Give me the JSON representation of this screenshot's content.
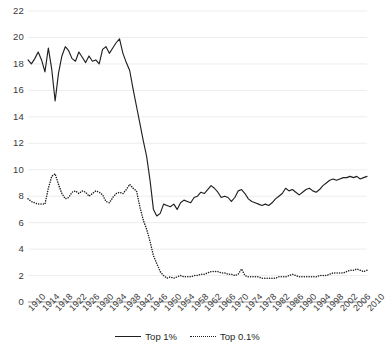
{
  "chart_data": {
    "type": "line",
    "title": "",
    "subtitle": "",
    "xlabel": "",
    "ylabel": "",
    "xlim": [
      1910,
      2010
    ],
    "ylim": [
      0,
      22
    ],
    "grid": true,
    "legend_position": "bottom",
    "y_ticks": [
      0,
      2,
      4,
      6,
      8,
      10,
      12,
      14,
      16,
      18,
      20,
      22
    ],
    "x_ticks": [
      1910,
      1914,
      1918,
      1922,
      1926,
      1930,
      1934,
      1938,
      1942,
      1946,
      1950,
      1954,
      1958,
      1962,
      1966,
      1970,
      1974,
      1978,
      1982,
      1986,
      1990,
      1994,
      1998,
      2002,
      2006,
      2010
    ],
    "x": [
      1910,
      1911,
      1912,
      1913,
      1914,
      1915,
      1916,
      1917,
      1918,
      1919,
      1920,
      1921,
      1922,
      1923,
      1924,
      1925,
      1926,
      1927,
      1928,
      1929,
      1930,
      1931,
      1932,
      1933,
      1934,
      1935,
      1936,
      1937,
      1938,
      1939,
      1940,
      1941,
      1942,
      1943,
      1944,
      1945,
      1946,
      1947,
      1948,
      1949,
      1950,
      1951,
      1952,
      1953,
      1954,
      1955,
      1956,
      1957,
      1958,
      1959,
      1960,
      1961,
      1962,
      1963,
      1964,
      1965,
      1966,
      1967,
      1968,
      1969,
      1970,
      1971,
      1972,
      1973,
      1974,
      1975,
      1976,
      1977,
      1978,
      1979,
      1980,
      1981,
      1982,
      1983,
      1984,
      1985,
      1986,
      1987,
      1988,
      1989,
      1990,
      1991,
      1992,
      1993,
      1994,
      1995,
      1996,
      1997,
      1998,
      1999,
      2000,
      2001,
      2002,
      2003,
      2004,
      2005,
      2006,
      2007,
      2008,
      2009,
      2010
    ],
    "series": [
      {
        "name": "Top 1%",
        "style": "solid",
        "color": "#231f20",
        "values": [
          18.3,
          18.0,
          18.4,
          18.9,
          18.3,
          17.4,
          19.2,
          17.6,
          15.2,
          17.3,
          18.6,
          19.3,
          19.0,
          18.4,
          18.2,
          18.9,
          18.5,
          18.1,
          18.6,
          18.2,
          18.3,
          18.0,
          19.1,
          19.3,
          18.8,
          19.2,
          19.6,
          19.9,
          18.8,
          18.1,
          17.5,
          16.1,
          14.8,
          13.5,
          12.2,
          11.0,
          9.2,
          7.0,
          6.5,
          6.7,
          7.4,
          7.3,
          7.2,
          7.4,
          7.0,
          7.5,
          7.7,
          7.6,
          7.5,
          7.9,
          8.0,
          8.3,
          8.2,
          8.5,
          8.8,
          8.6,
          8.3,
          7.9,
          8.0,
          7.9,
          7.6,
          7.9,
          8.4,
          8.5,
          8.2,
          7.8,
          7.6,
          7.5,
          7.4,
          7.3,
          7.4,
          7.3,
          7.5,
          7.8,
          8.0,
          8.2,
          8.6,
          8.4,
          8.5,
          8.3,
          8.1,
          8.3,
          8.5,
          8.6,
          8.4,
          8.3,
          8.5,
          8.8,
          9.0,
          9.2,
          9.3,
          9.2,
          9.3,
          9.4,
          9.4,
          9.5,
          9.4,
          9.5,
          9.3,
          9.4,
          9.5
        ]
      },
      {
        "name": "Top 0.1%",
        "style": "dotted",
        "color": "#231f20",
        "values": [
          7.8,
          7.6,
          7.5,
          7.4,
          7.4,
          7.4,
          8.6,
          9.5,
          9.7,
          8.9,
          8.2,
          7.8,
          7.9,
          8.3,
          8.4,
          8.2,
          8.4,
          8.3,
          8.0,
          8.2,
          8.4,
          8.3,
          8.1,
          7.6,
          7.5,
          7.9,
          8.2,
          8.3,
          8.2,
          8.5,
          8.9,
          8.6,
          8.4,
          7.2,
          6.2,
          5.5,
          4.6,
          3.5,
          2.9,
          2.3,
          2.0,
          1.8,
          1.9,
          1.8,
          1.9,
          2.0,
          1.9,
          1.9,
          1.9,
          2.0,
          2.0,
          2.1,
          2.1,
          2.2,
          2.3,
          2.3,
          2.3,
          2.2,
          2.2,
          2.1,
          2.1,
          2.0,
          2.1,
          2.5,
          2.0,
          1.9,
          1.9,
          1.9,
          1.9,
          1.8,
          1.8,
          1.8,
          1.8,
          1.8,
          1.9,
          1.9,
          1.9,
          2.0,
          2.1,
          2.0,
          1.9,
          1.9,
          1.9,
          1.9,
          1.9,
          1.9,
          2.0,
          2.0,
          2.0,
          2.1,
          2.2,
          2.2,
          2.2,
          2.2,
          2.3,
          2.4,
          2.4,
          2.5,
          2.4,
          2.3,
          2.4
        ]
      }
    ]
  },
  "legend": {
    "items": [
      {
        "label": "Top 1%"
      },
      {
        "label": "Top 0.1%"
      }
    ]
  }
}
